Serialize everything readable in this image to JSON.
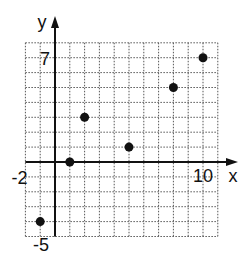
{
  "chart_data": {
    "type": "scatter",
    "title": "",
    "xlabel": "x",
    "ylabel": "y",
    "xlim": [
      -2,
      11
    ],
    "ylim": [
      -5,
      8
    ],
    "grid": true,
    "grid_style": "dotted",
    "x_tick_labels": [
      {
        "value": -2,
        "label": "-2"
      },
      {
        "value": 10,
        "label": "10"
      }
    ],
    "y_tick_labels": [
      {
        "value": 7,
        "label": "7"
      },
      {
        "value": -5,
        "label": "-5"
      }
    ],
    "points": [
      {
        "x": -1,
        "y": -4
      },
      {
        "x": 1,
        "y": 0
      },
      {
        "x": 2,
        "y": 3
      },
      {
        "x": 5,
        "y": 1
      },
      {
        "x": 8,
        "y": 5
      },
      {
        "x": 10,
        "y": 7
      }
    ],
    "marker_color": "#111111",
    "legend": null
  }
}
